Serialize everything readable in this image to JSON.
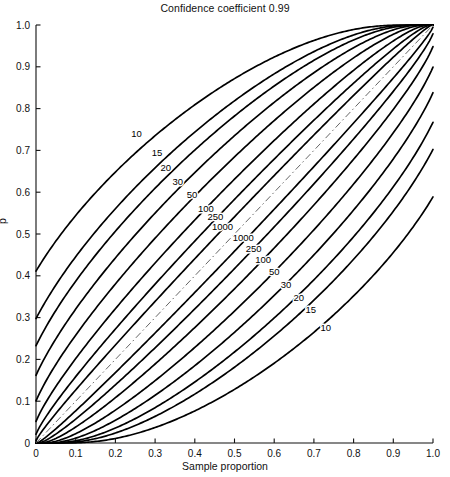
{
  "chart_data": {
    "type": "line",
    "title": "Confidence coefficient 0.99",
    "xlabel": "Sample proportion",
    "ylabel": "p",
    "xlim": [
      0,
      1
    ],
    "ylim": [
      0,
      1
    ],
    "grid": false,
    "legend": "none",
    "confidence_coefficient": 0.99,
    "xticks": [
      "0",
      "0.1",
      "0.2",
      "0.3",
      "0.4",
      "0.5",
      "0.6",
      "0.7",
      "0.8",
      "0.9",
      "1.0"
    ],
    "xtick_values": [
      0,
      0.1,
      0.2,
      0.3,
      0.4,
      0.5,
      0.6,
      0.7,
      0.8,
      0.9,
      1.0
    ],
    "yticks": [
      "0",
      "0.1",
      "0.2",
      "0.3",
      "0.4",
      "0.5",
      "0.6",
      "0.7",
      "0.8",
      "0.9",
      "1.0"
    ],
    "ytick_values": [
      0,
      0.1,
      0.2,
      0.3,
      0.4,
      0.5,
      0.6,
      0.7,
      0.8,
      0.9,
      1.0
    ],
    "sample_sizes": [
      10,
      15,
      20,
      30,
      50,
      100,
      250,
      1000
    ],
    "series_description": "Clopper-Pearson binomial confidence belts: for each sample size n an upper and a lower curve are drawn; all curves meet at (1.0, 1.0) and (0, 0).",
    "upper_curve_labels": [
      {
        "n": 10,
        "text": "10",
        "x": 0.253,
        "y": 0.733
      },
      {
        "n": 15,
        "text": "15",
        "x": 0.305,
        "y": 0.687
      },
      {
        "n": 20,
        "text": "20",
        "x": 0.327,
        "y": 0.65
      },
      {
        "n": 30,
        "text": "30",
        "x": 0.357,
        "y": 0.617
      },
      {
        "n": 50,
        "text": "50",
        "x": 0.393,
        "y": 0.587
      },
      {
        "n": 100,
        "text": "100",
        "x": 0.428,
        "y": 0.553
      },
      {
        "n": 250,
        "text": "250",
        "x": 0.452,
        "y": 0.533
      },
      {
        "n": 1000,
        "text": "1000",
        "x": 0.47,
        "y": 0.51
      }
    ],
    "lower_curve_labels": [
      {
        "n": 1000,
        "text": "1000",
        "x": 0.522,
        "y": 0.483
      },
      {
        "n": 250,
        "text": "250",
        "x": 0.548,
        "y": 0.458
      },
      {
        "n": 100,
        "text": "100",
        "x": 0.572,
        "y": 0.43
      },
      {
        "n": 50,
        "text": "50",
        "x": 0.6,
        "y": 0.402
      },
      {
        "n": 30,
        "text": "30",
        "x": 0.63,
        "y": 0.372
      },
      {
        "n": 20,
        "text": "20",
        "x": 0.662,
        "y": 0.34
      },
      {
        "n": 15,
        "text": "15",
        "x": 0.692,
        "y": 0.31
      },
      {
        "n": 10,
        "text": "10",
        "x": 0.73,
        "y": 0.268
      }
    ],
    "reference_line": {
      "name": "identity-line",
      "style": "dash-dot",
      "from": [
        0,
        0
      ],
      "to": [
        1,
        1
      ]
    }
  },
  "plot_geometry": {
    "left_px": 36,
    "right_px": 433,
    "top_px": 25,
    "bottom_px": 443
  }
}
